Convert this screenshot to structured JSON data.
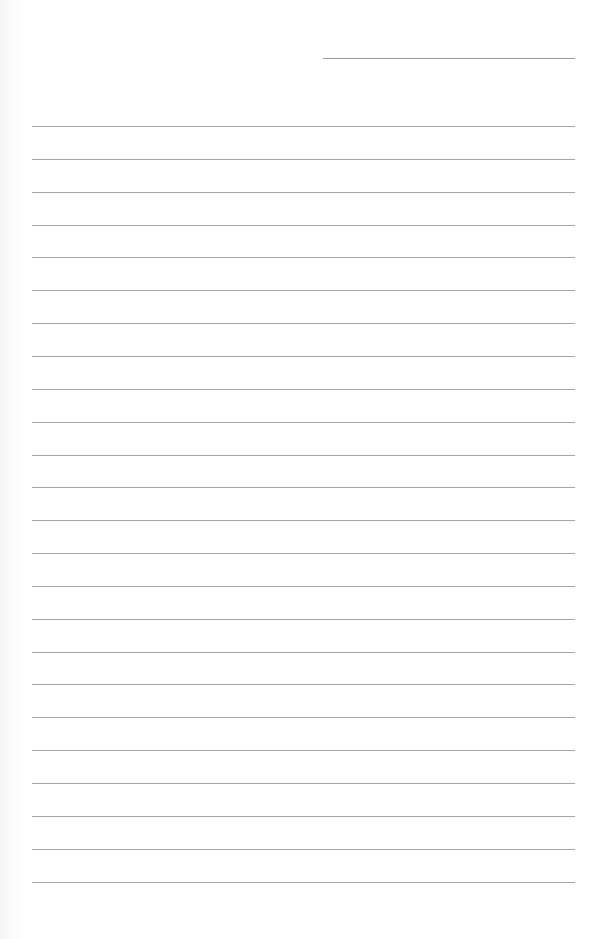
{
  "page": {
    "type": "lined-paper",
    "background": "#ffffff",
    "line_color": "#a6a6a6",
    "header_line": {
      "left": 323,
      "top": 58,
      "width": 252
    },
    "rules": {
      "count": 24,
      "left": 32,
      "width": 543,
      "first_top": 126,
      "spacing": 32.85
    }
  }
}
